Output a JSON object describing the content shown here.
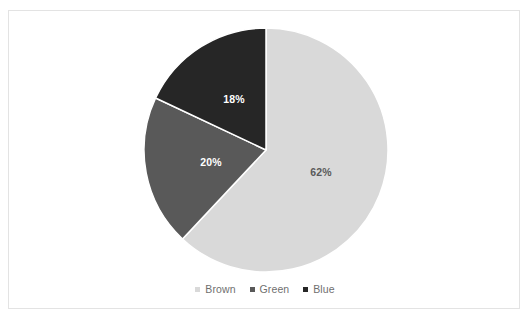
{
  "chart_data": {
    "type": "pie",
    "title": "",
    "subtitle": "",
    "xlabel": "",
    "ylabel": "",
    "legend_position": "bottom",
    "grid": false,
    "categories": [
      "Brown",
      "Green",
      "Blue"
    ],
    "values": [
      62,
      20,
      18
    ],
    "value_unit": "%",
    "data_labels": [
      "62%",
      "20%",
      "18%"
    ],
    "colors": [
      "#d9d9d9",
      "#595959",
      "#262626"
    ],
    "label_text_colors": [
      "#5a5a5a",
      "#ffffff",
      "#ffffff"
    ],
    "start_angle_deg": 0,
    "direction": "clockwise",
    "slices": [
      {
        "name": "Brown",
        "value": 62,
        "label": "62%",
        "color": "#d9d9d9",
        "start_deg": 0,
        "sweep_deg": 223.2,
        "label_x": 321,
        "label_y": 172,
        "label_on": "light"
      },
      {
        "name": "Green",
        "value": 20,
        "label": "20%",
        "color": "#595959",
        "start_deg": 223.2,
        "sweep_deg": 72,
        "label_x": 211,
        "label_y": 162,
        "label_on": "dark"
      },
      {
        "name": "Blue",
        "value": 18,
        "label": "18%",
        "color": "#262626",
        "start_deg": 295.2,
        "sweep_deg": 64.8,
        "label_x": 234,
        "label_y": 99,
        "label_on": "dark"
      }
    ],
    "geometry": {
      "center_x": 266,
      "center_y": 150,
      "radius": 122,
      "separator_color": "#ffffff",
      "separator_width": 1.5
    }
  },
  "legend": {
    "items": [
      {
        "label": "Brown",
        "color": "#d9d9d9"
      },
      {
        "label": "Green",
        "color": "#595959"
      },
      {
        "label": "Blue",
        "color": "#262626"
      }
    ]
  },
  "frame": {
    "border_color": "#e3e3e3",
    "background": "#ffffff"
  }
}
